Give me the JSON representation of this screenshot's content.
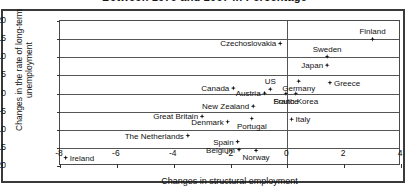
{
  "chart_data": {
    "type": "scatter",
    "title": "Between 1979 and 2007 in Percentage",
    "xlabel": "Changes in structural employment",
    "ylabel": "Changes in the rate of long-term unemployment",
    "xlim": [
      -8,
      4
    ],
    "ylim": [
      -20,
      20
    ],
    "xticks": [
      "-8",
      "-6",
      "-4",
      "-2",
      "0",
      "2",
      "4"
    ],
    "xtick_values": [
      -8,
      -6,
      -4,
      -2,
      0,
      2,
      4
    ],
    "yticks": [
      "20",
      "15",
      "10",
      "5",
      "0",
      "-5",
      "-10",
      "-15",
      "-20"
    ],
    "ytick_values": [
      20,
      15,
      10,
      5,
      0,
      -5,
      -10,
      -15,
      -20
    ],
    "grid": "horizontal",
    "legend": "none",
    "marker": "diamond",
    "marker_color": "#111111",
    "points": [
      {
        "label": "Finland",
        "x": 3.0,
        "y": 15.0,
        "pos": "t"
      },
      {
        "label": "Czechoslovakia",
        "x": -0.25,
        "y": 13.8,
        "pos": "r"
      },
      {
        "label": "Sweden",
        "x": 1.4,
        "y": 10.2,
        "pos": "t"
      },
      {
        "label": "Japan",
        "x": 1.4,
        "y": 7.8,
        "pos": "r"
      },
      {
        "label": "Germany",
        "x": 0.4,
        "y": 3.4,
        "pos": "b"
      },
      {
        "label": "Greece",
        "x": 1.5,
        "y": 3.0,
        "pos": "l"
      },
      {
        "label": "Canada",
        "x": -1.9,
        "y": 1.5,
        "pos": "r"
      },
      {
        "label": "US",
        "x": -0.6,
        "y": 1.2,
        "pos": "t"
      },
      {
        "label": "Austria",
        "x": -0.8,
        "y": 0.1,
        "pos": "r"
      },
      {
        "label": "France",
        "x": -0.05,
        "y": 0.0,
        "pos": "b"
      },
      {
        "label": "South Korea",
        "x": 0.3,
        "y": 0.0,
        "pos": "b"
      },
      {
        "label": "New Zealand",
        "x": -1.2,
        "y": -3.5,
        "pos": "r"
      },
      {
        "label": "Great Britain",
        "x": -3.0,
        "y": -6.3,
        "pos": "r"
      },
      {
        "label": "Portugal",
        "x": -1.25,
        "y": -6.9,
        "pos": "b"
      },
      {
        "label": "Italy",
        "x": 0.15,
        "y": -7.1,
        "pos": "l"
      },
      {
        "label": "Denmark",
        "x": -2.1,
        "y": -7.8,
        "pos": "r"
      },
      {
        "label": "The Netherlands",
        "x": -3.5,
        "y": -11.6,
        "pos": "r"
      },
      {
        "label": "Spain",
        "x": -1.75,
        "y": -13.3,
        "pos": "r"
      },
      {
        "label": "Belgium",
        "x": -1.7,
        "y": -15.5,
        "pos": "r"
      },
      {
        "label": "Norway",
        "x": -1.1,
        "y": -15.7,
        "pos": "b"
      },
      {
        "label": "Ireland",
        "x": -7.8,
        "y": -17.7,
        "pos": "l"
      }
    ]
  }
}
